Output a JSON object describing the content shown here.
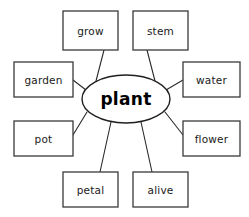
{
  "diagram": {
    "type": "word-web",
    "title": "plant",
    "center": {
      "label": "plant",
      "cx": 126,
      "cy": 99,
      "rx": 44,
      "ry": 24
    },
    "nodes": [
      {
        "id": "grow",
        "label": "grow",
        "x": 63,
        "y": 11,
        "width": 55,
        "height": 39,
        "line": {
          "x1": 104,
          "y1": 50,
          "x2": 96,
          "y2": 81
        }
      },
      {
        "id": "stem",
        "label": "stem",
        "x": 133,
        "y": 11,
        "width": 55,
        "height": 39,
        "line": {
          "x1": 147,
          "y1": 50,
          "x2": 155,
          "y2": 81
        }
      },
      {
        "id": "garden",
        "label": "garden",
        "x": 14,
        "y": 62,
        "width": 59,
        "height": 35,
        "line": {
          "x1": 73,
          "y1": 80,
          "x2": 86,
          "y2": 90
        }
      },
      {
        "id": "water",
        "label": "water",
        "x": 183,
        "y": 62,
        "width": 57,
        "height": 35,
        "line": {
          "x1": 183,
          "y1": 80,
          "x2": 166,
          "y2": 90
        }
      },
      {
        "id": "pot",
        "label": "pot",
        "x": 14,
        "y": 121,
        "width": 59,
        "height": 35,
        "line": {
          "x1": 73,
          "y1": 135,
          "x2": 87,
          "y2": 112
        }
      },
      {
        "id": "flower",
        "label": "flower",
        "x": 183,
        "y": 121,
        "width": 57,
        "height": 35,
        "line": {
          "x1": 183,
          "y1": 135,
          "x2": 165,
          "y2": 112
        }
      },
      {
        "id": "petal",
        "label": "petal",
        "x": 63,
        "y": 172,
        "width": 55,
        "height": 35,
        "line": {
          "x1": 100,
          "y1": 172,
          "x2": 111,
          "y2": 122
        }
      },
      {
        "id": "alive",
        "label": "alive",
        "x": 133,
        "y": 172,
        "width": 55,
        "height": 35,
        "line": {
          "x1": 152,
          "y1": 172,
          "x2": 141,
          "y2": 122
        }
      }
    ],
    "colors": {
      "background": "#ffffff",
      "box_stroke": "#3a3a3a",
      "line_stroke": "#2b2b2b",
      "text": "#1a1a1a",
      "center_text": "#000000"
    }
  }
}
